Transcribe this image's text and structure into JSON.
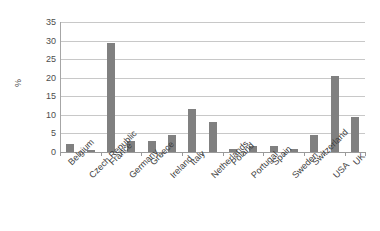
{
  "chart_data": {
    "type": "bar",
    "title": "",
    "subtitle": "",
    "xlabel": "",
    "ylabel": "%",
    "ylim": [
      0,
      35
    ],
    "ytick_step": 5,
    "yticks": [
      35,
      30,
      25,
      20,
      15,
      10,
      5,
      0
    ],
    "grid": true,
    "legend": false,
    "legend_position": "none",
    "bar_color": "#808080",
    "gridline_color": "#c8c8c8",
    "axis_color": "#9a9a9a",
    "categories": [
      "Belgium",
      "Czech Republic",
      "France",
      "Germany",
      "Greece",
      "Ireland",
      "Italy",
      "Netherlands",
      "Poland",
      "Portugal",
      "Spain",
      "Sweden",
      "Switzerland",
      "USA",
      "UK"
    ],
    "values": [
      2.2,
      0.6,
      29.4,
      3.1,
      3.1,
      4.7,
      11.7,
      8.2,
      0.8,
      1.5,
      1.6,
      0.8,
      4.5,
      20.5,
      9.3
    ]
  }
}
